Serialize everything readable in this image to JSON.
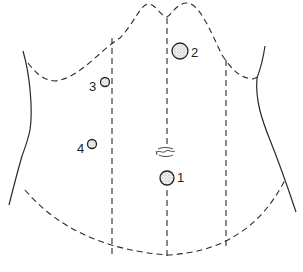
{
  "diagram": {
    "title": "",
    "type": "abdominal trocar port placement",
    "ports": [
      {
        "id": "1",
        "label": "1",
        "cx": 167,
        "cy": 178,
        "r": 7,
        "label_x": 177,
        "label_y": 176
      },
      {
        "id": "2",
        "label": "2",
        "cx": 180,
        "cy": 51,
        "r": 8,
        "label_x": 191,
        "label_y": 52
      },
      {
        "id": "3",
        "label": "3",
        "cx": 105,
        "cy": 82,
        "r": 4.5,
        "label_x": 90,
        "label_y": 82
      },
      {
        "id": "4",
        "label": "4",
        "cx": 92,
        "cy": 144,
        "r": 4.5,
        "label_x": 77,
        "label_y": 146
      }
    ],
    "umbilicus": {
      "label": "umbilicus",
      "x": 157,
      "y": 148
    },
    "colors": {
      "line": "#2a2a2a",
      "stipple": "#9a9a9a",
      "background": "#ffffff"
    }
  }
}
